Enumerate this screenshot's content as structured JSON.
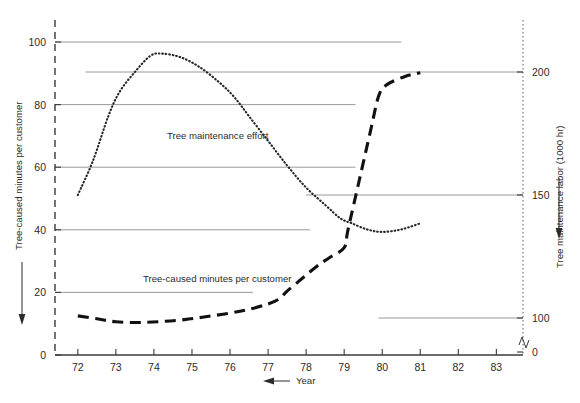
{
  "chart_data": {
    "type": "line",
    "title": "",
    "xlabel": "Year",
    "x_ticks": [
      "72",
      "73",
      "74",
      "75",
      "76",
      "77",
      "78",
      "79",
      "80",
      "81",
      "82",
      "83"
    ],
    "x_range": [
      71.4,
      83.7
    ],
    "grid": "partial horizontal reference lines",
    "legend_position": "inline annotations on curves",
    "axes": [
      {
        "id": "left",
        "label": "Tree-caused minutes per customer",
        "ticks": [
          0,
          20,
          40,
          60,
          80,
          100
        ],
        "range": [
          0,
          100
        ],
        "has_break": false
      },
      {
        "id": "right",
        "label": "Tree maintenance labor (1000 hr)",
        "ticks": [
          0,
          100,
          150,
          200
        ],
        "range": [
          0,
          200
        ],
        "has_break": true,
        "break_note": "axis break between 0 and 100"
      }
    ],
    "series": [
      {
        "name": "Tree maintenance effort",
        "axis": "right",
        "style": "dotted",
        "annotation": "Tree maintenance effort",
        "points": [
          {
            "x": 72.0,
            "y": 150.0
          },
          {
            "x": 72.4,
            "y": 164.0
          },
          {
            "x": 72.8,
            "y": 182.0
          },
          {
            "x": 73.1,
            "y": 192.0
          },
          {
            "x": 73.5,
            "y": 200.0
          },
          {
            "x": 73.9,
            "y": 206.5
          },
          {
            "x": 74.2,
            "y": 207.5
          },
          {
            "x": 74.7,
            "y": 206.0
          },
          {
            "x": 75.2,
            "y": 202.0
          },
          {
            "x": 75.7,
            "y": 196.0
          },
          {
            "x": 76.1,
            "y": 190.0
          },
          {
            "x": 76.5,
            "y": 182.0
          },
          {
            "x": 77.0,
            "y": 172.0
          },
          {
            "x": 77.5,
            "y": 162.0
          },
          {
            "x": 78.0,
            "y": 153.0
          },
          {
            "x": 78.5,
            "y": 146.0
          },
          {
            "x": 78.9,
            "y": 140.5
          },
          {
            "x": 79.2,
            "y": 138.5
          },
          {
            "x": 79.6,
            "y": 136.0
          },
          {
            "x": 80.0,
            "y": 135.0
          },
          {
            "x": 80.5,
            "y": 136.0
          },
          {
            "x": 81.0,
            "y": 138.5
          }
        ]
      },
      {
        "name": "Tree-caused minutes per customer",
        "axis": "left",
        "style": "dashed",
        "annotation": "Tree-caused minutes per customer",
        "points": [
          {
            "x": 72.0,
            "y": 12.5
          },
          {
            "x": 72.5,
            "y": 11.6
          },
          {
            "x": 73.0,
            "y": 10.6
          },
          {
            "x": 73.6,
            "y": 10.4
          },
          {
            "x": 74.2,
            "y": 10.7
          },
          {
            "x": 74.8,
            "y": 11.3
          },
          {
            "x": 75.4,
            "y": 12.3
          },
          {
            "x": 76.0,
            "y": 13.4
          },
          {
            "x": 76.5,
            "y": 14.6
          },
          {
            "x": 77.0,
            "y": 16.3
          },
          {
            "x": 77.3,
            "y": 18.0
          },
          {
            "x": 77.5,
            "y": 20.4
          },
          {
            "x": 77.9,
            "y": 24.5
          },
          {
            "x": 78.3,
            "y": 28.5
          },
          {
            "x": 78.6,
            "y": 31.0
          },
          {
            "x": 79.0,
            "y": 34.3
          },
          {
            "x": 79.1,
            "y": 40.0
          },
          {
            "x": 79.4,
            "y": 56.0
          },
          {
            "x": 79.7,
            "y": 72.0
          },
          {
            "x": 79.9,
            "y": 82.5
          },
          {
            "x": 80.1,
            "y": 86.2
          },
          {
            "x": 80.6,
            "y": 89.0
          },
          {
            "x": 81.0,
            "y": 90.2
          }
        ]
      }
    ],
    "reference_lines": [
      {
        "axis": "left",
        "value": 100,
        "x_start": 71.4,
        "x_end": 80.5
      },
      {
        "axis": "right",
        "value": 200,
        "x_start": 72.2,
        "x_end": 83.7
      },
      {
        "axis": "left",
        "value": 80,
        "x_start": 71.4,
        "x_end": 79.3
      },
      {
        "axis": "left",
        "value": 60,
        "x_start": 71.4,
        "x_end": 79.3
      },
      {
        "axis": "right",
        "value": 150,
        "x_start": 78.0,
        "x_end": 83.7
      },
      {
        "axis": "left",
        "value": 40,
        "x_start": 71.4,
        "x_end": 78.1
      },
      {
        "axis": "left",
        "value": 20,
        "x_start": 71.4,
        "x_end": 76.6
      },
      {
        "axis": "right",
        "value": 100,
        "x_start": 79.9,
        "x_end": 83.7
      }
    ]
  },
  "labels": {
    "left_axis_title": "Tree-caused minutes per customer",
    "right_axis_title": "Tree maintenance labor (1000 hr)",
    "x_axis_title": "Year",
    "annotation_effort": "Tree maintenance effort",
    "annotation_minutes": "Tree-caused minutes per customer",
    "left_ticks": [
      "100",
      "80",
      "60",
      "40",
      "20",
      "0"
    ],
    "right_ticks": [
      "200",
      "150",
      "100",
      "0"
    ],
    "x_ticks": [
      "72",
      "73",
      "74",
      "75",
      "76",
      "77",
      "78",
      "79",
      "80",
      "81",
      "82",
      "83"
    ]
  },
  "colors": {
    "background": "#ffffff",
    "axis": "#3a3a3a",
    "gridline": "#8d8d8d",
    "series_dotted": "#262626",
    "series_dashed": "#111111",
    "text": "#2b2b2b"
  }
}
